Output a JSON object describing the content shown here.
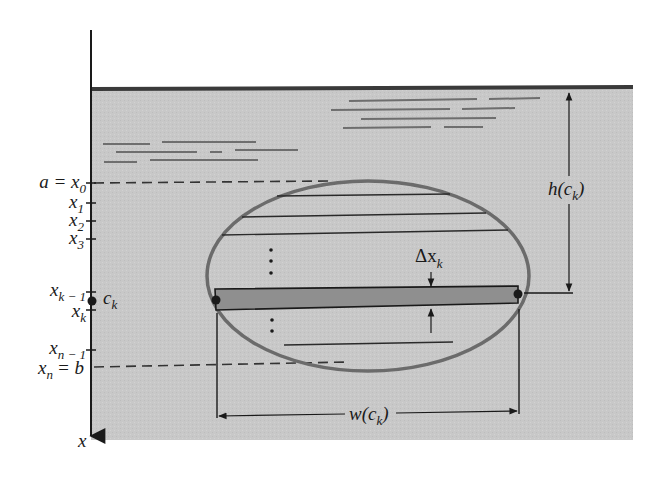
{
  "figure": {
    "colors": {
      "background": "#ffffff",
      "fluid": "#c9c9c9",
      "surface_line": "#3a3a3a",
      "ellipse_stroke": "#6b6b6b",
      "strip_fill": "#8f8f8f",
      "ink": "#1a1a1a",
      "ripple": "#6e6e6e"
    },
    "axis": {
      "label": "x",
      "ticks": [
        {
          "id": "x0",
          "main": "a = x",
          "sub": "0",
          "y": 183
        },
        {
          "id": "x1",
          "main": "x",
          "sub": "1",
          "y": 203
        },
        {
          "id": "x2",
          "main": "x",
          "sub": "2",
          "y": 221
        },
        {
          "id": "x3",
          "main": "x",
          "sub": "3",
          "y": 239
        },
        {
          "id": "xk-1",
          "main": "x",
          "sub": "k − 1",
          "y": 292
        },
        {
          "id": "xk",
          "main": "x",
          "sub": "k",
          "y": 310
        },
        {
          "id": "xn-1",
          "main": "x",
          "sub": "n − 1",
          "y": 350
        },
        {
          "id": "xn",
          "main": "x",
          "sub": "n",
          "suffix": "= b",
          "y": 367
        }
      ],
      "sample_point": {
        "main": "c",
        "sub": "k",
        "y": 301
      }
    },
    "labels": {
      "delta": "Δx",
      "delta_sub": "k",
      "height_main": "h(c",
      "height_sub": "k",
      "height_close": ")",
      "width_main": "w(c",
      "width_sub": "k",
      "width_close": ")",
      "ellipsis": "⋮"
    }
  }
}
